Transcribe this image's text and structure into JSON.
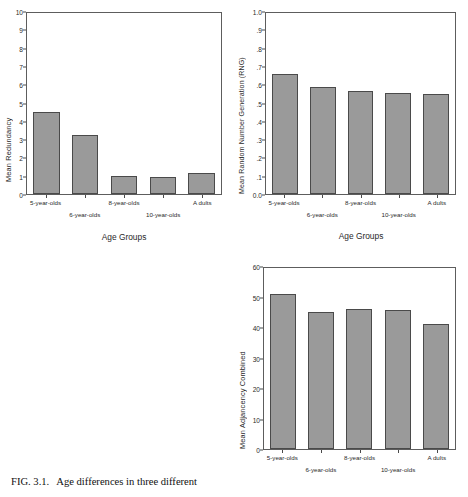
{
  "figure": {
    "caption_number": "FIG. 3.1.",
    "caption_text": "Age differences in three different"
  },
  "categories": [
    "5-year-olds",
    "6-year-olds",
    "8-year-olds",
    "10-year-olds",
    "A dults"
  ],
  "chart_data": [
    {
      "type": "bar",
      "id": "mean-redundancy",
      "title": "",
      "xlabel": "Age Groups",
      "ylabel": "Mean Redundancy",
      "categories": [
        "5-year-olds",
        "6-year-olds",
        "8-year-olds",
        "10-year-olds",
        "A dults"
      ],
      "values": [
        4.55,
        3.25,
        1.0,
        0.95,
        1.15
      ],
      "ylim": [
        0,
        10
      ],
      "yticks": [
        "0",
        "1",
        "2",
        "3",
        "4",
        "5",
        "6",
        "7",
        "8",
        "9",
        "10"
      ],
      "grid": false,
      "legend": "none",
      "bar_color": "#9a9a9a",
      "bar_border": "#4a4a4a"
    },
    {
      "type": "bar",
      "id": "mean-rng",
      "title": "",
      "xlabel": "Age Groups",
      "ylabel": "Mean Random Number Generation (RNG)",
      "categories": [
        "5-year-olds",
        "6-year-olds",
        "8-year-olds",
        "10-year-olds",
        "A dults"
      ],
      "values": [
        0.665,
        0.59,
        0.57,
        0.56,
        0.555
      ],
      "ylim": [
        0.0,
        1.0
      ],
      "yticks": [
        "0.0",
        ".1",
        ".2",
        ".3",
        ".4",
        ".5",
        ".6",
        ".7",
        ".8",
        ".9",
        "1.0"
      ],
      "grid": false,
      "legend": "none",
      "bar_color": "#9a9a9a",
      "bar_border": "#4a4a4a"
    },
    {
      "type": "bar",
      "id": "mean-adjancency",
      "title": "",
      "xlabel": "",
      "ylabel": "Mean Adjancency Combined",
      "categories": [
        "5-year-olds",
        "6-year-olds",
        "8-year-olds",
        "10-year-olds",
        "A dults"
      ],
      "values": [
        51.5,
        45.5,
        46.5,
        46.0,
        41.5
      ],
      "ylim": [
        0,
        60
      ],
      "yticks": [
        "0",
        "10",
        "20",
        "30",
        "40",
        "50",
        "60"
      ],
      "grid": false,
      "legend": "none",
      "bar_color": "#9a9a9a",
      "bar_border": "#4a4a4a"
    }
  ]
}
